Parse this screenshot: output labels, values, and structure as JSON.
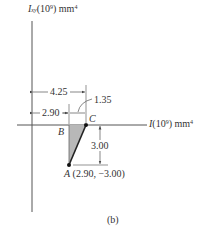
{
  "figure": {
    "caption": "(b)",
    "axes": {
      "vertical": {
        "symbol": "I",
        "subscript": "xy",
        "unit_prefix": "(10",
        "exponent": "9",
        "unit_suffix": ") mm",
        "unit_exponent": "4"
      },
      "horizontal": {
        "symbol": "I",
        "unit_prefix": "(10",
        "exponent": "9",
        "unit_suffix": ") mm",
        "unit_exponent": "4"
      }
    },
    "points": {
      "A": {
        "label": "A",
        "coords": "(2.90, −3.00)"
      },
      "B": {
        "label": "B"
      },
      "C": {
        "label": "C"
      }
    },
    "dimensions": {
      "oc": "4.25",
      "ob": "2.90",
      "bc": "1.35",
      "ab": "3.00"
    },
    "colors": {
      "line": "#3a3a3a",
      "triangle_fill": "#b8b8b8",
      "background": "#ffffff"
    }
  }
}
